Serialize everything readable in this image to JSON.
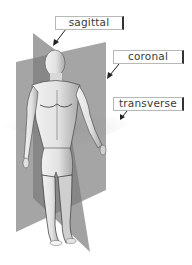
{
  "diagram": {
    "labels": [
      {
        "id": "sagittal",
        "text": "sagittal"
      },
      {
        "id": "coronal",
        "text": "coronal"
      },
      {
        "id": "transverse",
        "text": "transverse"
      }
    ],
    "colors": {
      "plane": "#8a8a8a",
      "transverse_plane": "#d9d9d9",
      "body": "#e8e8e8",
      "label_text": "#3a3a3a",
      "arrow": "#222222"
    }
  }
}
